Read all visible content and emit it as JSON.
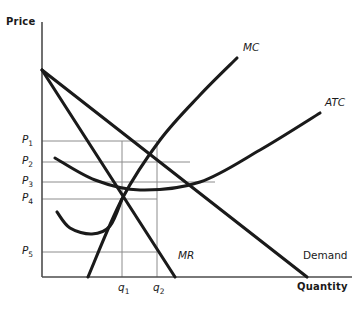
{
  "figure": {
    "type": "economics-diagram",
    "subtype": "monopoly-cost-and-revenue",
    "axes": {
      "y_title": "Price",
      "x_title": "Quantity",
      "origin_px": [
        42,
        277
      ],
      "y_top_px": 22,
      "x_right_px": 352
    },
    "colors": {
      "curve": "#1a1a1a",
      "gridline": "#8c8c8c",
      "axis": "#4d4d4d",
      "background": "#ffffff",
      "text": "#1a1a1a"
    }
  },
  "price_ticks": [
    {
      "label": "P",
      "sub": "1",
      "y_px": 141
    },
    {
      "label": "P",
      "sub": "2",
      "y_px": 162
    },
    {
      "label": "P",
      "sub": "3",
      "y_px": 182
    },
    {
      "label": "P",
      "sub": "4",
      "y_px": 199
    },
    {
      "label": "P",
      "sub": "5",
      "y_px": 252
    }
  ],
  "quantity_ticks": [
    {
      "label": "q",
      "sub": "1",
      "x_px": 122
    },
    {
      "label": "q",
      "sub": "2",
      "x_px": 157
    }
  ],
  "curve_labels": [
    {
      "name": "MC",
      "text": "MC",
      "x_px": 243,
      "y_px": 48,
      "italic": true
    },
    {
      "name": "ATC",
      "text": "ATC",
      "x_px": 325,
      "y_px": 103,
      "italic": true
    },
    {
      "name": "MR",
      "text": "MR",
      "x_px": 178,
      "y_px": 256,
      "italic": true
    },
    {
      "name": "Demand",
      "text": "Demand",
      "x_px": 303,
      "y_px": 256,
      "italic": false
    }
  ],
  "chart_data": {
    "type": "line",
    "title": "",
    "xlabel": "Quantity",
    "ylabel": "Price",
    "grid": true,
    "legend": "inline-curve-labels",
    "series": [
      {
        "name": "Demand",
        "kind": "straight",
        "points_px": [
          [
            42,
            70
          ],
          [
            307,
            277
          ]
        ],
        "note": "downward-sloping market demand curve"
      },
      {
        "name": "MR",
        "kind": "straight",
        "points_px": [
          [
            42,
            70
          ],
          [
            175,
            277
          ]
        ],
        "note": "marginal revenue, twice the slope of demand"
      },
      {
        "name": "MC",
        "kind": "curve",
        "points_px": [
          [
            88,
            277
          ],
          [
            122,
            199
          ],
          [
            160,
            140
          ],
          [
            200,
            95
          ],
          [
            237,
            58
          ]
        ],
        "note": "marginal cost, upward sloping, cuts AVC and ATC at their minima"
      },
      {
        "name": "ATC",
        "kind": "curve",
        "points_px": [
          [
            55,
            158
          ],
          [
            95,
            180
          ],
          [
            140,
            190
          ],
          [
            200,
            182
          ],
          [
            260,
            150
          ],
          [
            320,
            113
          ]
        ],
        "note": "average total cost, U-shaped with minimum near q between q1 and q2"
      },
      {
        "name": "AVC",
        "kind": "curve",
        "points_px": [
          [
            57,
            212
          ],
          [
            70,
            228
          ],
          [
            92,
            234
          ],
          [
            110,
            226
          ],
          [
            122,
            199
          ]
        ],
        "note": "unlabeled lower U-shaped average variable cost curve"
      }
    ],
    "gridlines_y_px": [
      141,
      162,
      182,
      199,
      252
    ],
    "gridlines_x_px": [
      122,
      157
    ],
    "annotations": [
      "P1 gridline extends right to the q2 vertical",
      "P2, P3, P4 gridlines extend right past the MC/ATC region",
      "P5 gridline extends right to the q2 vertical"
    ]
  }
}
